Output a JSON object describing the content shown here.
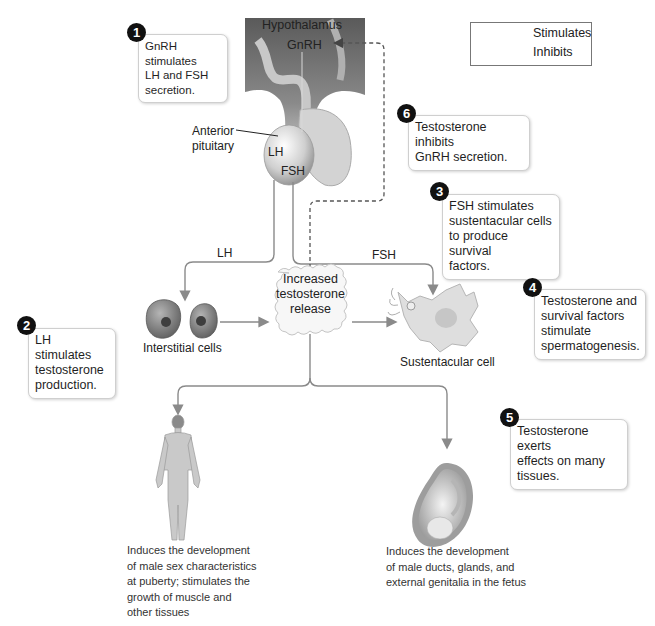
{
  "legend": {
    "items": [
      {
        "label": "Stimulates",
        "style": "solid"
      },
      {
        "label": "Inhibits",
        "style": "dashed"
      }
    ]
  },
  "structures": {
    "hypothalamus": "Hypothalamus",
    "gnrh": "GnRH",
    "anterior_pituitary": "Anterior\npituitary",
    "anterior_pituitary_line1": "Anterior",
    "anterior_pituitary_line2": "pituitary",
    "lh_inside": "LH",
    "fsh_inside": "FSH"
  },
  "arrows": {
    "lh_label": "LH",
    "fsh_label": "FSH"
  },
  "nodes": {
    "interstitial_cells": "Interstitial cells",
    "sustentacular_cell": "Sustentacular cell",
    "release": {
      "line1": "Increased",
      "line2": "testosterone",
      "line3": "release"
    }
  },
  "steps": [
    {
      "num": "1",
      "text": "GnRH stimulates LH and FSH secretion.",
      "lines": [
        "GnRH stimulates",
        "LH and FSH",
        "secretion."
      ]
    },
    {
      "num": "2",
      "text": "LH stimulates testosterone production.",
      "lines": [
        "LH stimulates",
        "testosterone",
        "production."
      ]
    },
    {
      "num": "3",
      "text": "FSH stimulates sustentacular cells to produce survival factors.",
      "lines": [
        "FSH stimulates",
        "sustentacular cells",
        "to produce survival",
        "factors."
      ]
    },
    {
      "num": "4",
      "text": "Testosterone and survival factors stimulate spermatogenesis.",
      "lines": [
        "Testosterone and",
        "survival factors",
        "stimulate",
        "spermatogenesis."
      ]
    },
    {
      "num": "5",
      "text": "Testosterone exerts effects on many tissues.",
      "lines": [
        "Testosterone exerts",
        "effects on many",
        "tissues."
      ]
    },
    {
      "num": "6",
      "text": "Testosterone inhibits GnRH secretion.",
      "lines": [
        "Testosterone inhibits",
        "GnRH secretion."
      ]
    }
  ],
  "captions": {
    "adult": [
      "Induces the development",
      "of male sex characteristics",
      "at puberty; stimulates the",
      "growth of muscle and",
      "other tissues"
    ],
    "fetus": [
      "Induces the development",
      "of male ducts, glands, and",
      "external genitalia in the fetus"
    ]
  },
  "colors": {
    "arrow": "#8a8a8a",
    "dashed": "#555555",
    "badge": "#111111",
    "callout_border": "#cfcfcf",
    "cell_fill": "#8f8f8f",
    "tissue": "#bdbdbd"
  }
}
